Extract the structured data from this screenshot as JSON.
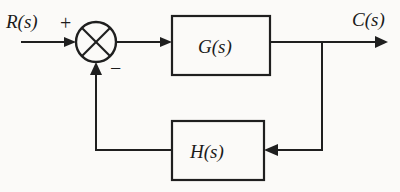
{
  "diagram": {
    "background_color": "#fbfaf8",
    "line_color": "#1f1f1f",
    "signals": {
      "input_label": "R(s)",
      "output_label": "C(s)"
    },
    "summing_junction": {
      "name": "summing-junction",
      "style": "circle-with-x-cross",
      "center_x": 96,
      "center_y": 42,
      "radius": 20,
      "positive_sign": "+",
      "negative_sign": "−"
    },
    "blocks": [
      {
        "id": "forward-block",
        "label": "G(s)",
        "x": 172,
        "y": 16,
        "width": 98,
        "height": 59
      },
      {
        "id": "feedback-block",
        "label": "H(s)",
        "x": 172,
        "y": 121,
        "width": 92,
        "height": 59
      }
    ],
    "connections": [
      {
        "id": "input-to-sum",
        "from": "R(s)",
        "to": "summing-junction",
        "arrow": true
      },
      {
        "id": "sum-to-forward-block",
        "from": "summing-junction",
        "to": "G(s)",
        "arrow": true
      },
      {
        "id": "forward-block-to-output",
        "from": "G(s)",
        "to": "C(s)",
        "arrow": true
      },
      {
        "id": "output-branch-to-feedback-block",
        "from": "output-branch-point",
        "to": "H(s)",
        "arrow": true
      },
      {
        "id": "feedback-block-to-sum",
        "from": "H(s)",
        "to": "summing-junction",
        "arrow": true
      }
    ]
  }
}
